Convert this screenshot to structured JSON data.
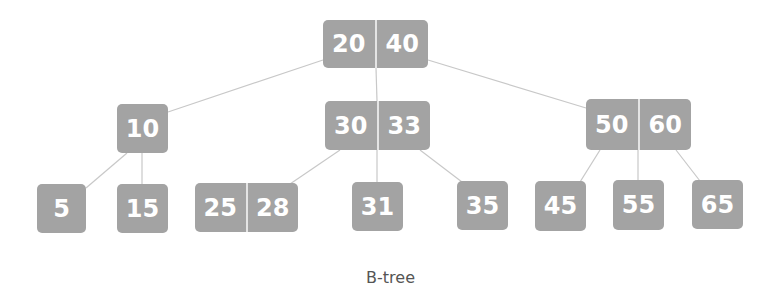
{
  "diagram": {
    "caption": "B-tree",
    "colors": {
      "node_fill": "#a3a3a3",
      "key_text": "#ffffff",
      "edge": "#c8c8c8",
      "divider": "#e4e4e4"
    },
    "nodes": [
      {
        "id": "root",
        "keys": [
          "20",
          "40"
        ],
        "x": 323,
        "y": 20,
        "w": 105,
        "h": 48
      },
      {
        "id": "n10",
        "keys": [
          "10"
        ],
        "x": 117,
        "y": 104,
        "w": 51,
        "h": 49
      },
      {
        "id": "n3033",
        "keys": [
          "30",
          "33"
        ],
        "x": 325,
        "y": 101,
        "w": 105,
        "h": 49
      },
      {
        "id": "n5060",
        "keys": [
          "50",
          "60"
        ],
        "x": 586,
        "y": 99,
        "w": 105,
        "h": 51
      },
      {
        "id": "n5",
        "keys": [
          "5"
        ],
        "x": 37,
        "y": 184,
        "w": 49,
        "h": 49
      },
      {
        "id": "n15",
        "keys": [
          "15"
        ],
        "x": 117,
        "y": 184,
        "w": 51,
        "h": 49
      },
      {
        "id": "n2528",
        "keys": [
          "25",
          "28"
        ],
        "x": 195,
        "y": 183,
        "w": 103,
        "h": 49
      },
      {
        "id": "n31",
        "keys": [
          "31"
        ],
        "x": 352,
        "y": 182,
        "w": 51,
        "h": 49
      },
      {
        "id": "n35",
        "keys": [
          "35"
        ],
        "x": 457,
        "y": 181,
        "w": 51,
        "h": 49
      },
      {
        "id": "n45",
        "keys": [
          "45"
        ],
        "x": 535,
        "y": 181,
        "w": 51,
        "h": 50
      },
      {
        "id": "n55",
        "keys": [
          "55"
        ],
        "x": 613,
        "y": 180,
        "w": 51,
        "h": 50
      },
      {
        "id": "n65",
        "keys": [
          "65"
        ],
        "x": 692,
        "y": 180,
        "w": 51,
        "h": 49
      }
    ],
    "edges": [
      {
        "from": "root",
        "to": "n10",
        "x1": 323,
        "y1": 60,
        "x2": 168,
        "y2": 112
      },
      {
        "from": "root",
        "to": "n3033",
        "x1": 376,
        "y1": 68,
        "x2": 377,
        "y2": 101
      },
      {
        "from": "root",
        "to": "n5060",
        "x1": 428,
        "y1": 60,
        "x2": 586,
        "y2": 108
      },
      {
        "from": "n10",
        "to": "n5",
        "x1": 127,
        "y1": 153,
        "x2": 86,
        "y2": 188
      },
      {
        "from": "n10",
        "to": "n15",
        "x1": 142,
        "y1": 153,
        "x2": 142,
        "y2": 184
      },
      {
        "from": "n3033",
        "to": "n2528",
        "x1": 340,
        "y1": 150,
        "x2": 290,
        "y2": 184
      },
      {
        "from": "n3033",
        "to": "n31",
        "x1": 377,
        "y1": 150,
        "x2": 377,
        "y2": 182
      },
      {
        "from": "n3033",
        "to": "n35",
        "x1": 420,
        "y1": 150,
        "x2": 462,
        "y2": 182
      },
      {
        "from": "n5060",
        "to": "n45",
        "x1": 600,
        "y1": 150,
        "x2": 580,
        "y2": 182
      },
      {
        "from": "n5060",
        "to": "n55",
        "x1": 638,
        "y1": 150,
        "x2": 638,
        "y2": 180
      },
      {
        "from": "n5060",
        "to": "n65",
        "x1": 676,
        "y1": 150,
        "x2": 700,
        "y2": 181
      }
    ]
  }
}
